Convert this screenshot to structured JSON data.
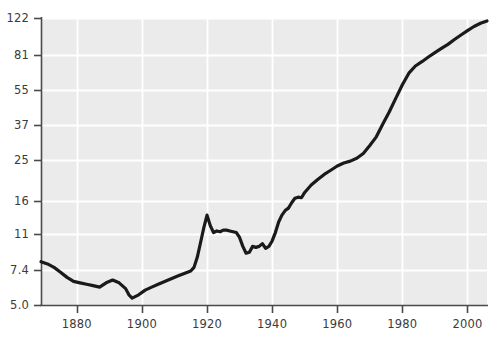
{
  "chart_data": {
    "type": "line",
    "title": "",
    "subtitle": "",
    "xlabel": "",
    "ylabel": "",
    "yscale": "log",
    "xscale": "linear",
    "grid": true,
    "legend": null,
    "legend_position": "none",
    "xlim": [
      1869,
      2006
    ],
    "ylim": [
      5.0,
      122
    ],
    "xticks": [
      1880,
      1900,
      1920,
      1940,
      1960,
      1980,
      2000
    ],
    "xticklabels": [
      "1880",
      "1900",
      "1920",
      "1940",
      "1960",
      "1980",
      "2000"
    ],
    "yticks": [
      5.0,
      7.4,
      11,
      16,
      25,
      37,
      55,
      81,
      122
    ],
    "yticklabels": [
      "5.0",
      "7.4",
      "11",
      "16",
      "25",
      "37",
      "55",
      "81",
      "122"
    ],
    "series": [
      {
        "name": "series-1",
        "color": "#1a1a1a",
        "linewidth": 3.2,
        "x": [
          1869,
          1871,
          1873,
          1875,
          1877,
          1879,
          1881,
          1883,
          1885,
          1887,
          1889,
          1891,
          1893,
          1895,
          1896,
          1897,
          1899,
          1901,
          1903,
          1905,
          1907,
          1909,
          1911,
          1913,
          1915,
          1916,
          1917,
          1918,
          1919,
          1920,
          1921,
          1922,
          1923,
          1924,
          1925,
          1926,
          1927,
          1928,
          1929,
          1930,
          1931,
          1932,
          1933,
          1934,
          1935,
          1936,
          1937,
          1938,
          1939,
          1940,
          1941,
          1942,
          1943,
          1944,
          1945,
          1946,
          1947,
          1948,
          1949,
          1950,
          1952,
          1954,
          1956,
          1958,
          1960,
          1962,
          1964,
          1966,
          1968,
          1970,
          1972,
          1974,
          1976,
          1978,
          1980,
          1982,
          1984,
          1986,
          1988,
          1990,
          1992,
          1994,
          1996,
          1998,
          2000,
          2002,
          2004,
          2006
        ],
        "y": [
          8.1,
          7.9,
          7.6,
          7.2,
          6.8,
          6.5,
          6.4,
          6.3,
          6.2,
          6.1,
          6.4,
          6.6,
          6.4,
          6.0,
          5.6,
          5.4,
          5.6,
          5.9,
          6.1,
          6.3,
          6.5,
          6.7,
          6.9,
          7.1,
          7.3,
          7.6,
          8.5,
          10.0,
          11.8,
          13.6,
          12.1,
          11.2,
          11.4,
          11.3,
          11.5,
          11.5,
          11.4,
          11.3,
          11.2,
          10.6,
          9.6,
          8.9,
          9.0,
          9.6,
          9.5,
          9.6,
          9.9,
          9.4,
          9.6,
          10.2,
          11.2,
          12.6,
          13.6,
          14.3,
          14.7,
          15.6,
          16.4,
          16.6,
          16.5,
          17.5,
          19.0,
          20.2,
          21.4,
          22.4,
          23.5,
          24.3,
          24.8,
          25.6,
          27.0,
          29.5,
          32.5,
          37.5,
          43.0,
          50.0,
          58.0,
          66.0,
          71.5,
          75.0,
          79.0,
          83.0,
          87.0,
          91.0,
          96.0,
          101.0,
          106.0,
          111.0,
          115.0,
          118.0
        ]
      }
    ]
  },
  "plot": {
    "background_color": "#ebebeb",
    "grid_color": "#ffffff",
    "axis_color": "#4a4a4a",
    "line_color": "#1a1a1a"
  }
}
